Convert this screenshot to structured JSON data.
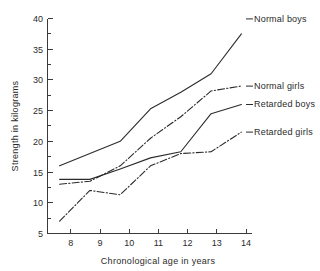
{
  "chart_data": {
    "type": "line",
    "title": "",
    "xlabel": "Chronological age in years",
    "ylabel": "Strength in kilograms",
    "x": [
      8,
      9,
      10,
      11,
      12,
      13,
      14
    ],
    "xlim": [
      7.6,
      14.35
    ],
    "ylim": [
      5,
      40
    ],
    "xticks": [
      "8",
      "9",
      "10",
      "11",
      "12",
      "13",
      "14"
    ],
    "yticks": [
      "5",
      "10",
      "15",
      "20",
      "25",
      "30",
      "35",
      "40"
    ],
    "yticks_minor": [
      7.5,
      12.5,
      17.5,
      22.5,
      27.5,
      32.5,
      37.5
    ],
    "grid": false,
    "legend_position": "right-inline-labels",
    "series": [
      {
        "name": "Normal boys",
        "style": "solid",
        "values": [
          16.0,
          18.0,
          20.0,
          25.3,
          28.0,
          31.0,
          37.5
        ],
        "label_value": "37.5"
      },
      {
        "name": "Normal girls",
        "style": "dash-dot",
        "values": [
          13.0,
          13.5,
          16.0,
          20.5,
          24.0,
          28.2,
          29.0
        ],
        "label_value": "29.0"
      },
      {
        "name": "Retarded boys",
        "style": "solid",
        "values": [
          13.8,
          13.8,
          15.5,
          17.3,
          18.3,
          24.5,
          26.0
        ],
        "label_value": "26.0"
      },
      {
        "name": "Retarded girls",
        "style": "dash-dot",
        "values": [
          7.0,
          12.0,
          11.3,
          16.0,
          18.0,
          18.3,
          21.5
        ],
        "label_value": "21.5"
      }
    ]
  },
  "labels": {
    "normal_boys": "Normal boys",
    "normal_girls": "Normal girls",
    "retarded_boys": "Retarded boys",
    "retarded_girls": "Retarded girls",
    "x_axis_title": "Chronological age in years",
    "y_axis_title": "Strength in kilograms"
  },
  "axis": {
    "y_tick_40": "40",
    "y_tick_35": "35",
    "y_tick_30": "30",
    "y_tick_25": "25",
    "y_tick_20": "20",
    "y_tick_15": "15",
    "y_tick_10": "10",
    "y_tick_5": "5",
    "x_tick_8": "8",
    "x_tick_9": "9",
    "x_tick_10": "10",
    "x_tick_11": "11",
    "x_tick_12": "12",
    "x_tick_13": "13",
    "x_tick_14": "14"
  },
  "colors": {
    "ink": "#2b2b2b",
    "axis": "#3a3a3a",
    "background": "#ffffff"
  }
}
